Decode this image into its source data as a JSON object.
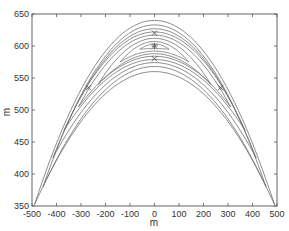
{
  "chart_data": {
    "type": "contour",
    "title": "",
    "xlabel": "m",
    "ylabel": "m",
    "xlim": [
      -500,
      500
    ],
    "ylim": [
      350,
      650
    ],
    "xticks": [
      -500,
      -400,
      -300,
      -200,
      -100,
      0,
      100,
      200,
      300,
      400,
      500
    ],
    "yticks": [
      350,
      400,
      450,
      500,
      550,
      600,
      650
    ],
    "xtick_labels": [
      "-500",
      "-400",
      "-300",
      "-200",
      "-100",
      "0",
      "100",
      "200",
      "300",
      "400",
      "500"
    ],
    "ytick_labels": [
      "350",
      "400",
      "450",
      "500",
      "550",
      "600",
      "650"
    ],
    "grid": false,
    "legend": null,
    "contour_shape": "nested arch (inverted-parabola) contours symmetric about x=0, apex near y≈600-640, limbs reaching y≈350 at x≈±480",
    "contour_levels_count": 8,
    "markers": [
      {
        "symbol": "*",
        "x": 0,
        "y": 600,
        "note": "central maximum"
      },
      {
        "symbol": "x",
        "x": 0,
        "y": 620
      },
      {
        "symbol": "x",
        "x": 0,
        "y": 580
      },
      {
        "symbol": "x",
        "x": -270,
        "y": 535
      },
      {
        "symbol": "x",
        "x": 270,
        "y": 535
      }
    ],
    "colors": {
      "lines": "#707070",
      "background": "#ffffff",
      "axes": "#555555"
    }
  }
}
